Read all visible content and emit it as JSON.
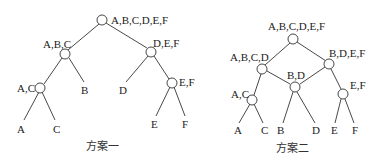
{
  "diagrams": [
    {
      "caption": "方案一",
      "nodes": [
        {
          "id": "root",
          "label": "A,B,C,D,E,F"
        },
        {
          "id": "abc",
          "label": "A,B,C"
        },
        {
          "id": "def",
          "label": "D,E,F"
        },
        {
          "id": "ac",
          "label": "A,C"
        },
        {
          "id": "ef",
          "label": "E,F"
        },
        {
          "id": "A",
          "label": "A"
        },
        {
          "id": "C",
          "label": "C"
        },
        {
          "id": "B",
          "label": "B"
        },
        {
          "id": "D",
          "label": "D"
        },
        {
          "id": "E",
          "label": "E"
        },
        {
          "id": "F",
          "label": "F"
        }
      ],
      "edges": [
        [
          "root",
          "abc"
        ],
        [
          "root",
          "def"
        ],
        [
          "abc",
          "ac"
        ],
        [
          "abc",
          "B"
        ],
        [
          "def",
          "D"
        ],
        [
          "def",
          "ef"
        ],
        [
          "ac",
          "A"
        ],
        [
          "ac",
          "C"
        ],
        [
          "ef",
          "E"
        ],
        [
          "ef",
          "F"
        ]
      ]
    },
    {
      "caption": "方案二",
      "nodes": [
        {
          "id": "root",
          "label": "A,B,C,D,E,F"
        },
        {
          "id": "abcd",
          "label": "A,B,C,D"
        },
        {
          "id": "bdef",
          "label": "B,D,E,F"
        },
        {
          "id": "bd",
          "label": "B,D"
        },
        {
          "id": "ac",
          "label": "A,C"
        },
        {
          "id": "ef",
          "label": "E,F"
        },
        {
          "id": "A",
          "label": "A"
        },
        {
          "id": "C",
          "label": "C"
        },
        {
          "id": "B",
          "label": "B"
        },
        {
          "id": "D",
          "label": "D"
        },
        {
          "id": "E",
          "label": "E"
        },
        {
          "id": "F",
          "label": "F"
        }
      ],
      "edges": [
        [
          "root",
          "abcd"
        ],
        [
          "root",
          "bdef"
        ],
        [
          "abcd",
          "ac"
        ],
        [
          "abcd",
          "bd"
        ],
        [
          "bdef",
          "bd"
        ],
        [
          "bdef",
          "ef"
        ],
        [
          "ac",
          "A"
        ],
        [
          "ac",
          "C"
        ],
        [
          "bd",
          "B"
        ],
        [
          "bd",
          "D"
        ],
        [
          "ef",
          "E"
        ],
        [
          "ef",
          "F"
        ]
      ]
    }
  ]
}
